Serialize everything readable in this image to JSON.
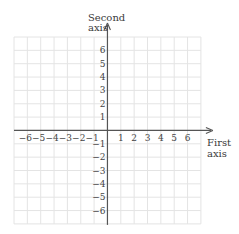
{
  "chart_data": {
    "type": "grid",
    "title": "",
    "xlabel": "First axis",
    "ylabel": "Second axis",
    "xlabel_lines": [
      "First",
      "axis"
    ],
    "ylabel_lines": [
      "Second",
      "axis"
    ],
    "x_ticks": [
      -6,
      -5,
      -4,
      -3,
      -2,
      -1,
      1,
      2,
      3,
      4,
      5,
      6
    ],
    "y_ticks": [
      6,
      5,
      4,
      3,
      2,
      1,
      -1,
      -2,
      -3,
      -4,
      -5,
      -6
    ],
    "x_tick_labels": [
      "−6",
      "−5",
      "−4",
      "−3",
      "−2",
      "−1",
      "1",
      "2",
      "3",
      "4",
      "5",
      "6"
    ],
    "y_tick_labels": [
      "6",
      "5",
      "4",
      "3",
      "2",
      "1",
      "−1",
      "−2",
      "−3",
      "−4",
      "−5",
      "−6"
    ],
    "xlim": [
      -7,
      7
    ],
    "ylim": [
      -7,
      7
    ],
    "grid": true,
    "colors": {
      "grid": "#e4e4e4",
      "axis": "#555555"
    }
  }
}
